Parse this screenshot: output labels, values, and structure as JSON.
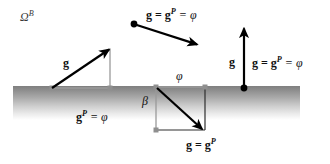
{
  "figure": {
    "width": 330,
    "height": 164,
    "background_color": "#ffffff"
  },
  "ground": {
    "name": "ground-band",
    "top_y": 86,
    "fade_bottom_y": 120,
    "left_x": 13,
    "right_x": 300,
    "color_top": "#8a8a8a",
    "color_bottom": "#ffffff"
  },
  "labels": {
    "domain": "Ω",
    "domain_subscript": "B",
    "g": "g",
    "gp_equals_phi": "g",
    "gp_sup": "P",
    "gp_eq": " = ",
    "phi": "φ",
    "beta": "β",
    "g_eq": "g = g",
    "g_sup": "P",
    "g_eq_phi_tail": " = φ",
    "g_eq_gp": "g = g",
    "g_eq_gp_sup": "P"
  },
  "annotations": {
    "omega_b": {
      "text": "Ω",
      "subscript": "B",
      "x": 20,
      "y": 10
    },
    "left_vector_label": {
      "text": "g",
      "x": 63,
      "y": 57
    },
    "left_ground_label": {
      "base": "g",
      "sup": "P",
      "tail": " = φ",
      "x": 76,
      "y": 110
    },
    "top_vector_label": {
      "base": "g = g",
      "sup": "P",
      "tail": " = φ",
      "x": 146,
      "y": 8
    },
    "box_phi_label": {
      "text": "φ",
      "x": 176,
      "y": 70
    },
    "box_beta_label": {
      "text": "β",
      "x": 142,
      "y": 95
    },
    "box_bottom_label": {
      "base": "g = g",
      "sup": "P",
      "x": 186,
      "y": 138
    },
    "right_vector_label": {
      "text": "g",
      "x": 229,
      "y": 56
    },
    "right_full_label": {
      "base": "g = g",
      "sup": "P",
      "tail": " = φ",
      "x": 252,
      "y": 56
    }
  },
  "vectors": {
    "left_arrow": {
      "name": "left-gradient-arrow",
      "x1": 52,
      "y1": 88,
      "x2": 110,
      "y2": 49,
      "color": "#000000",
      "width": 2.2
    },
    "top_arrow": {
      "name": "top-gradient-arrow",
      "x1": 134,
      "y1": 24,
      "x2": 198,
      "y2": 45,
      "color": "#000000",
      "width": 2.2,
      "has_start_dot": true
    },
    "right_arrow": {
      "name": "right-gradient-arrow",
      "x1": 244,
      "y1": 88,
      "x2": 244,
      "y2": 27,
      "color": "#000000",
      "width": 2.2,
      "has_start_dot": true
    },
    "box_diagonal_arrow": {
      "name": "box-diagonal-arrow",
      "x1": 157,
      "y1": 88,
      "x2": 203,
      "y2": 130,
      "color": "#000000",
      "width": 2.2
    }
  },
  "guides": {
    "left_drop_line": {
      "name": "left-drop-guide",
      "x1": 110,
      "y1": 49,
      "x2": 110,
      "y2": 89,
      "color": "#9a9a9a"
    },
    "left_base_line": {
      "name": "left-base-guide",
      "x1": 52,
      "y1": 88,
      "x2": 110,
      "y2": 88,
      "color": "#9a9a9a"
    },
    "box_top_edge": {
      "name": "box-top-edge",
      "x1": 156,
      "y1": 87,
      "x2": 205,
      "y2": 87,
      "color": "#9a9a9a"
    },
    "box_left_edge": {
      "name": "box-left-edge",
      "x1": 156,
      "y1": 87,
      "x2": 156,
      "y2": 130,
      "color": "#9a9a9a"
    },
    "box_bottom_edge": {
      "name": "box-bottom-edge",
      "x1": 156,
      "y1": 130,
      "x2": 205,
      "y2": 130,
      "color": "#333333"
    },
    "box_right_edge": {
      "name": "box-right-edge",
      "x1": 205,
      "y1": 87,
      "x2": 205,
      "y2": 130,
      "color": "#333333"
    }
  },
  "markers": {
    "node_color": "#8f8f8f",
    "dot_color": "#000000"
  }
}
